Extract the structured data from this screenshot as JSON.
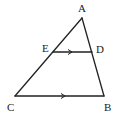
{
  "diagram": {
    "type": "geometry-triangle",
    "points": {
      "A": {
        "label": "A"
      },
      "B": {
        "label": "B"
      },
      "C": {
        "label": "C"
      },
      "D": {
        "label": "D"
      },
      "E": {
        "label": "E"
      }
    },
    "segments": [
      {
        "from": "A",
        "to": "C"
      },
      {
        "from": "A",
        "to": "B"
      },
      {
        "from": "C",
        "to": "B",
        "parallel_mark": true
      },
      {
        "from": "E",
        "to": "D",
        "parallel_mark": true
      }
    ],
    "relations": [
      "ED ∥ CB"
    ],
    "line_color": "#222222"
  }
}
